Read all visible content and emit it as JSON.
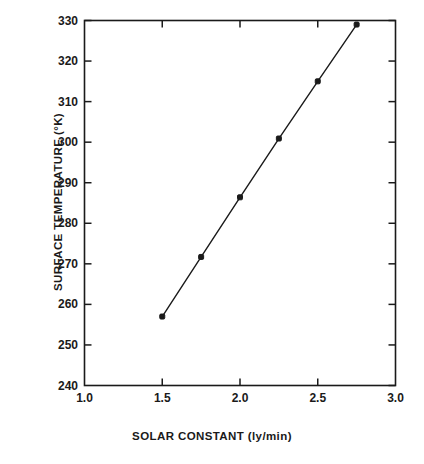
{
  "chart_data": {
    "type": "line",
    "title": "",
    "subtitle": "",
    "xlabel": "SOLAR CONSTANT (ly/min)",
    "ylabel": "SURFACE TEMPERATURE (°K)",
    "xlim": [
      1.0,
      3.0
    ],
    "ylim": [
      240,
      330
    ],
    "xticks": [
      "1.0",
      "1.5",
      "2.0",
      "2.5",
      "3.0"
    ],
    "xtick_values": [
      1.0,
      1.5,
      2.0,
      2.5,
      3.0
    ],
    "yticks": [
      "240",
      "250",
      "260",
      "270",
      "280",
      "290",
      "300",
      "310",
      "320",
      "330"
    ],
    "ytick_values": [
      240,
      250,
      260,
      270,
      280,
      290,
      300,
      310,
      320,
      330
    ],
    "grid": false,
    "legend": null,
    "marker": "filled-square",
    "line_color": "#1a1a1a",
    "marker_color": "#1a1a1a",
    "background_color": "#ffffff",
    "x": [
      1.5,
      1.75,
      2.0,
      2.25,
      2.5,
      2.75
    ],
    "series": [
      {
        "name": "Surface temperature vs solar constant",
        "values": [
          257.0,
          271.7,
          286.4,
          300.9,
          315.0,
          329.0
        ]
      }
    ],
    "points": [
      {
        "x": 1.5,
        "y": 257.0
      },
      {
        "x": 1.75,
        "y": 271.7
      },
      {
        "x": 2.0,
        "y": 286.4
      },
      {
        "x": 2.25,
        "y": 300.9
      },
      {
        "x": 2.5,
        "y": 315.0
      },
      {
        "x": 2.75,
        "y": 329.0
      }
    ],
    "annotations": []
  }
}
